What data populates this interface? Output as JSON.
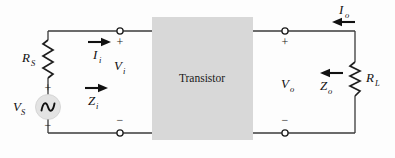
{
  "diagram": {
    "type": "circuit-schematic",
    "background_color": "#fdfdfd",
    "wire_color": "#3a3a3a",
    "block": {
      "label": "Transistor",
      "fill_color": "#d8d8d8"
    },
    "source": {
      "symbol": "ac-source",
      "label_base": "V",
      "label_sub": "S",
      "plus": "+",
      "minus": "−",
      "fill_color": "#e0e0e0"
    },
    "components": [
      {
        "name": "source-resistor",
        "label_base": "R",
        "label_sub": "S",
        "kind": "resistor"
      },
      {
        "name": "load-resistor",
        "label_base": "R",
        "label_sub": "L",
        "kind": "resistor"
      }
    ],
    "quantities": [
      {
        "name": "input-current",
        "label_base": "I",
        "label_sub": "i",
        "arrow": "right"
      },
      {
        "name": "input-voltage",
        "label_base": "V",
        "label_sub": "i",
        "arrow": "none"
      },
      {
        "name": "input-impedance",
        "label_base": "Z",
        "label_sub": "i",
        "arrow": "right"
      },
      {
        "name": "output-voltage",
        "label_base": "V",
        "label_sub": "o",
        "arrow": "none"
      },
      {
        "name": "output-impedance",
        "label_base": "Z",
        "label_sub": "o",
        "arrow": "left"
      },
      {
        "name": "output-current",
        "label_base": "I",
        "label_sub": "o",
        "arrow": "left"
      }
    ],
    "terminals": [
      {
        "name": "input-top-terminal",
        "polarity": "+"
      },
      {
        "name": "input-bottom-terminal",
        "polarity": "−"
      },
      {
        "name": "output-top-terminal",
        "polarity": "+"
      },
      {
        "name": "output-bottom-terminal",
        "polarity": "−"
      }
    ]
  }
}
